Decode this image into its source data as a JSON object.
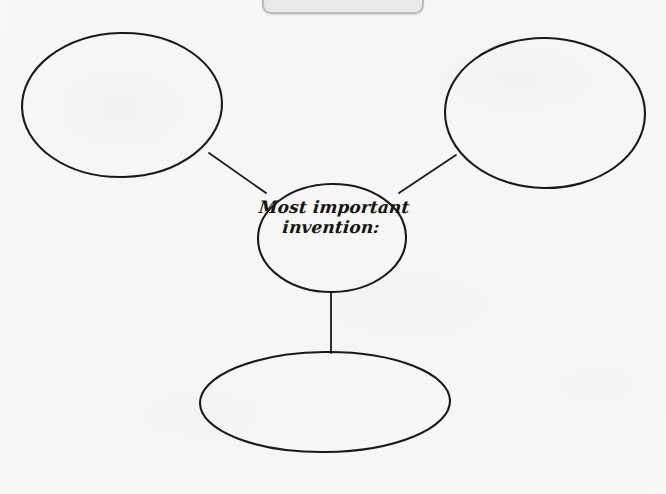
{
  "page": {
    "kind": "handwritten-worksheet-scan",
    "paper_color": "#f7f7f6",
    "ink_color": "#1a1a18",
    "width": 666,
    "height": 494
  },
  "diagram": {
    "type": "concept-map",
    "center": {
      "label_line_1": "Most important",
      "label_line_2": "invention:",
      "shape": "ellipse",
      "cx": 332,
      "cy": 238,
      "rx": 74,
      "ry": 54
    },
    "branches": [
      {
        "id": "top-left",
        "label": "",
        "shape": "ellipse",
        "cx": 122,
        "cy": 105,
        "rx": 100,
        "ry": 72
      },
      {
        "id": "top-right",
        "label": "",
        "shape": "ellipse",
        "cx": 545,
        "cy": 113,
        "rx": 100,
        "ry": 75
      },
      {
        "id": "bottom",
        "label": "",
        "shape": "ellipse",
        "cx": 325,
        "cy": 402,
        "rx": 125,
        "ry": 50
      }
    ],
    "connectors": [
      {
        "id": "center-to-top-left",
        "x1": 209,
        "y1": 153,
        "x2": 266,
        "y2": 193
      },
      {
        "id": "center-to-top-right",
        "x1": 399,
        "y1": 193,
        "x2": 456,
        "y2": 155
      },
      {
        "id": "center-to-bottom",
        "x1": 331,
        "y1": 292,
        "x2": 331,
        "y2": 353
      }
    ]
  },
  "top_ghost_bar": {
    "description": "faint rounded bar clipped at top edge",
    "left": 262,
    "right": 420
  }
}
